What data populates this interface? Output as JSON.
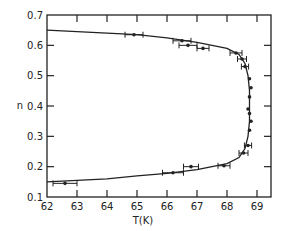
{
  "chart_data": {
    "type": "scatter",
    "title": "",
    "xlabel": "T(K)",
    "ylabel": "n",
    "xlim": [
      62,
      69.5
    ],
    "ylim": [
      0.1,
      0.7
    ],
    "x_ticks": [
      "62",
      "63",
      "64",
      "65",
      "66",
      "67",
      "68",
      "69"
    ],
    "y_ticks": [
      "0.1",
      "0.2",
      "0.3",
      "0.4",
      "0.5",
      "0.6",
      "0.7"
    ],
    "grid": false,
    "legend": null,
    "series": [
      {
        "name": "data",
        "style": "points with horizontal error bars",
        "points": [
          {
            "x": 62.6,
            "y": 0.145,
            "xerr": 0.4
          },
          {
            "x": 66.2,
            "y": 0.18,
            "xerr": 0.35
          },
          {
            "x": 66.8,
            "y": 0.2,
            "xerr": 0.25
          },
          {
            "x": 67.9,
            "y": 0.203,
            "xerr": 0.2
          },
          {
            "x": 68.55,
            "y": 0.245,
            "xerr": 0.15
          },
          {
            "x": 68.7,
            "y": 0.27,
            "xerr": 0.12
          },
          {
            "x": 68.75,
            "y": 0.32,
            "xerr": 0
          },
          {
            "x": 68.8,
            "y": 0.35,
            "xerr": 0
          },
          {
            "x": 68.75,
            "y": 0.375,
            "xerr": 0
          },
          {
            "x": 68.7,
            "y": 0.39,
            "xerr": 0
          },
          {
            "x": 68.75,
            "y": 0.43,
            "xerr": 0
          },
          {
            "x": 68.8,
            "y": 0.46,
            "xerr": 0
          },
          {
            "x": 68.75,
            "y": 0.49,
            "xerr": 0
          },
          {
            "x": 68.6,
            "y": 0.53,
            "xerr": 0.12
          },
          {
            "x": 68.5,
            "y": 0.555,
            "xerr": 0.15
          },
          {
            "x": 68.3,
            "y": 0.575,
            "xerr": 0.2
          },
          {
            "x": 67.2,
            "y": 0.59,
            "xerr": 0.2
          },
          {
            "x": 66.7,
            "y": 0.6,
            "xerr": 0.3
          },
          {
            "x": 66.5,
            "y": 0.615,
            "xerr": 0.3
          },
          {
            "x": 64.9,
            "y": 0.635,
            "xerr": 0.3
          }
        ]
      },
      {
        "name": "fit curve",
        "style": "solid line",
        "points": [
          {
            "x": 62.0,
            "y": 0.15
          },
          {
            "x": 63.0,
            "y": 0.155
          },
          {
            "x": 64.0,
            "y": 0.16
          },
          {
            "x": 65.0,
            "y": 0.17
          },
          {
            "x": 66.0,
            "y": 0.178
          },
          {
            "x": 67.0,
            "y": 0.19
          },
          {
            "x": 68.0,
            "y": 0.21
          },
          {
            "x": 68.4,
            "y": 0.23
          },
          {
            "x": 68.6,
            "y": 0.26
          },
          {
            "x": 68.7,
            "y": 0.3
          },
          {
            "x": 68.75,
            "y": 0.35
          },
          {
            "x": 68.75,
            "y": 0.4
          },
          {
            "x": 68.75,
            "y": 0.45
          },
          {
            "x": 68.7,
            "y": 0.5
          },
          {
            "x": 68.6,
            "y": 0.54
          },
          {
            "x": 68.4,
            "y": 0.57
          },
          {
            "x": 68.0,
            "y": 0.59
          },
          {
            "x": 67.0,
            "y": 0.61
          },
          {
            "x": 66.0,
            "y": 0.625
          },
          {
            "x": 65.0,
            "y": 0.635
          },
          {
            "x": 64.0,
            "y": 0.64
          },
          {
            "x": 63.0,
            "y": 0.645
          },
          {
            "x": 62.0,
            "y": 0.65
          }
        ]
      }
    ]
  }
}
